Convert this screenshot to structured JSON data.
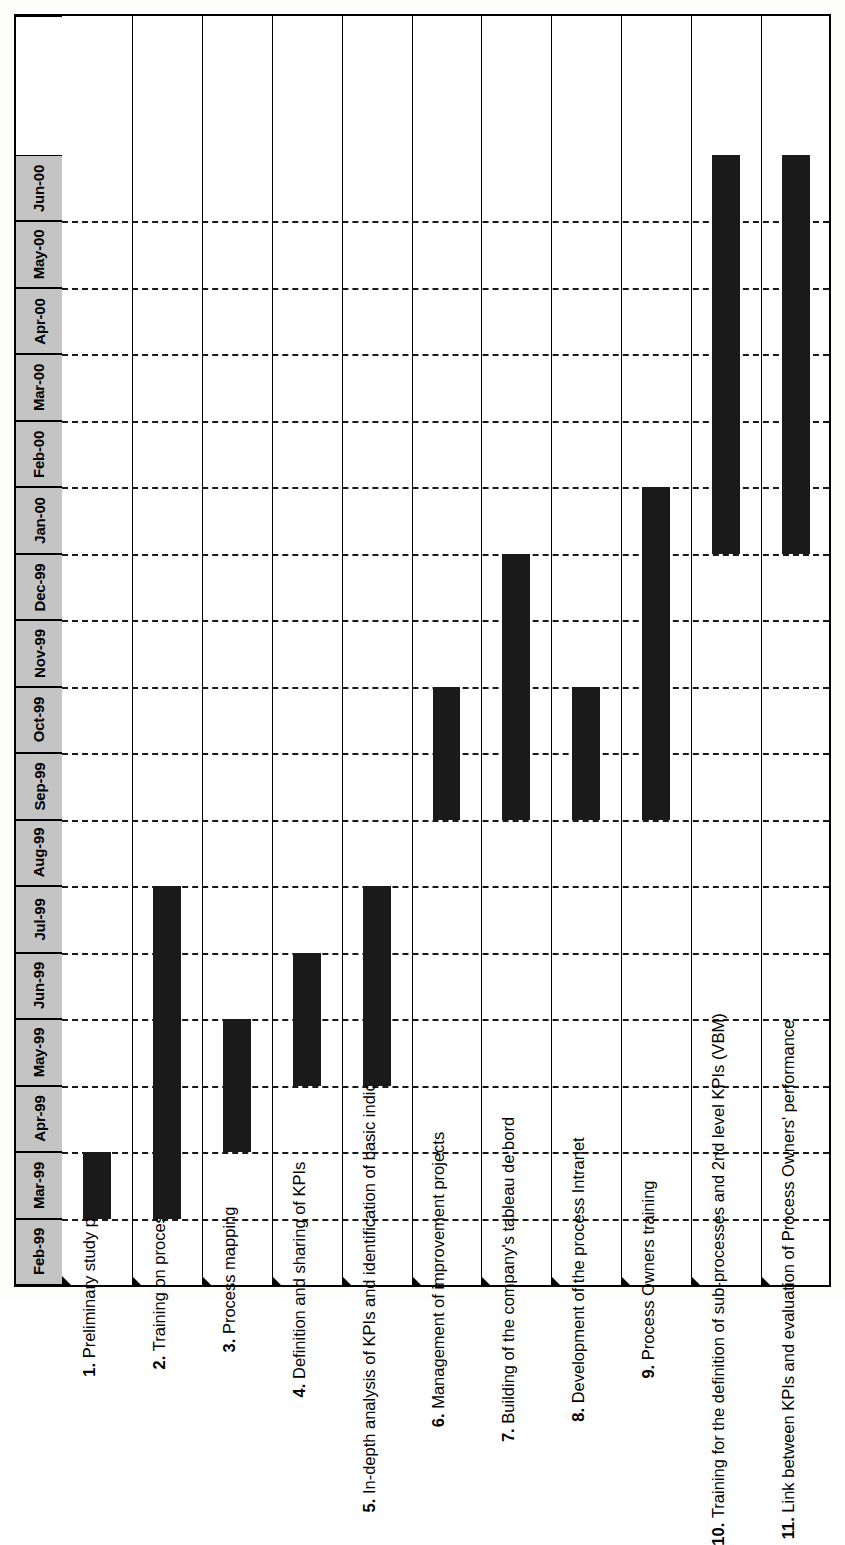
{
  "chart_data": {
    "type": "bar",
    "chart_kind": "gantt",
    "title": "",
    "xlabel": "",
    "ylabel": "",
    "orientation": "rotated-90-ccw",
    "grid": true,
    "legend": "none",
    "bar_color": "#1a1a1a",
    "header_fill": "#c4c4c4",
    "timeline_label": "Months",
    "categories": [
      "Feb-99",
      "Mar-99",
      "Apr-99",
      "May-99",
      "Jun-99",
      "Jul-99",
      "Aug-99",
      "Sep-99",
      "Oct-99",
      "Nov-99",
      "Dec-99",
      "Jan-00",
      "Feb-00",
      "Mar-00",
      "Apr-00",
      "May-00",
      "Jun-00"
    ],
    "axis_range": [
      "Feb-99",
      "Jun-00"
    ],
    "tasks": [
      {
        "number": "1.",
        "label": "Preliminary study phase",
        "start": "Mar-99",
        "end": "Mar-99",
        "start_index": 1,
        "end_index": 2,
        "duration_months": 1
      },
      {
        "number": "2.",
        "label": "Training on processes",
        "start": "Mar-99",
        "end": "Jul-99",
        "start_index": 1,
        "end_index": 6,
        "duration_months": 5
      },
      {
        "number": "3.",
        "label": "Process mapping",
        "start": "Apr-99",
        "end": "May-99",
        "start_index": 2,
        "end_index": 4,
        "duration_months": 2
      },
      {
        "number": "4.",
        "label": "Definition and sharing of KPIs",
        "start": "May-99",
        "end": "Jun-99",
        "start_index": 3,
        "end_index": 5,
        "duration_months": 2
      },
      {
        "number": "5.",
        "label": "In-depth analysis of KPIs and identification of basic indicators",
        "start": "May-99",
        "end": "Jul-99",
        "start_index": 3,
        "end_index": 6,
        "duration_months": 3
      },
      {
        "number": "6.",
        "label": "Management of improvement projects",
        "start": "Sep-99",
        "end": "Oct-99",
        "start_index": 7,
        "end_index": 9,
        "duration_months": 2
      },
      {
        "number": "7.",
        "label": "Building of the company's tableau de bord",
        "start": "Sep-99",
        "end": "Dec-99",
        "start_index": 7,
        "end_index": 11,
        "duration_months": 4
      },
      {
        "number": "8.",
        "label": "Development of the process Intranet",
        "start": "Sep-99",
        "end": "Oct-99",
        "start_index": 7,
        "end_index": 9,
        "duration_months": 2
      },
      {
        "number": "9.",
        "label": "Process Owners training",
        "start": "Sep-99",
        "end": "Jan-00",
        "start_index": 7,
        "end_index": 12,
        "duration_months": 5
      },
      {
        "number": "10.",
        "label": "Training for the definition of sub-processes and 2nd level KPIs (VBM)",
        "start": "Jan-00",
        "end": "Jun-00",
        "start_index": 11,
        "end_index": 17,
        "duration_months": 6
      },
      {
        "number": "11.",
        "label": "Link between KPIs and evaluation of Process Owners' performance",
        "start": "Jan-00",
        "end": "Jun-00",
        "start_index": 11,
        "end_index": 17,
        "duration_months": 6
      }
    ]
  }
}
